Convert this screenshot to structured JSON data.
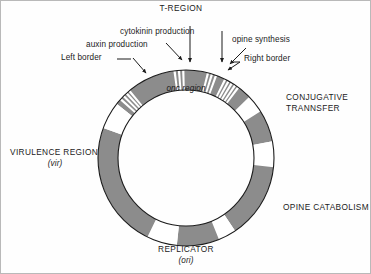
{
  "figure": {
    "kind": "ti-plasmid-circular-map",
    "background_color": "#ffffff",
    "frame_color": "#b9b9b9",
    "segment_fill": "#8c8c8c",
    "ring_outline": "#1b1b1b",
    "text_color": "#1b1b1b"
  },
  "top_labels": {
    "t_region": "T-REGION",
    "cytokinin": "cytokinin production",
    "auxin": "auxin production",
    "left_border": "Left border",
    "opine_synthesis": "opine  synthesis",
    "right_border": "Right border"
  },
  "ring_labels": {
    "onc_region": "onc region",
    "conjugative_line1": "CONJUGATIVE",
    "conjugative_line2": "TRANNSFER",
    "opine_catabolism": "OPINE CATABOLISM",
    "replicator": "REPLICATOR",
    "replicator_sub": "(ori)",
    "virulence": "VIRULENCE REGION",
    "virulence_sub": "(vir)"
  },
  "chart_data": {
    "type": "pie",
    "geometry": {
      "cx": 186,
      "cy": 158,
      "r_outer": 88,
      "r_inner": 68,
      "angle_zero": "top",
      "direction": "clockwise"
    },
    "legend_position": "around-ring",
    "grid": false,
    "segments": [
      {
        "name": "T-region (onc region)",
        "start_deg": -52,
        "end_deg": 46,
        "fill": "#8c8c8c",
        "striped": true
      },
      {
        "name": "conjugative-transfer-upper",
        "start_deg": 58,
        "end_deg": 79,
        "fill": "#8c8c8c"
      },
      {
        "name": "conjugative-transfer-gap",
        "start_deg": 79,
        "end_deg": 96,
        "fill": "#ffffff"
      },
      {
        "name": "opine-catabolism",
        "start_deg": 96,
        "end_deg": 146,
        "fill": "#8c8c8c"
      },
      {
        "name": "opine-catabolism-gap",
        "start_deg": 146,
        "end_deg": 158,
        "fill": "#ffffff"
      },
      {
        "name": "replicator",
        "start_deg": 158,
        "end_deg": 186,
        "fill": "#8c8c8c"
      },
      {
        "name": "replicator-gap",
        "start_deg": 186,
        "end_deg": 206,
        "fill": "#ffffff"
      },
      {
        "name": "virulence-region",
        "start_deg": 206,
        "end_deg": 290,
        "fill": "#8c8c8c"
      },
      {
        "name": "virulence-gap",
        "start_deg": 290,
        "end_deg": 308,
        "fill": "#ffffff"
      }
    ],
    "t_region_stripes": {
      "left_border_group_deg": [
        -48,
        -45.2,
        -42.6,
        -40.2
      ],
      "cytokinin_group_deg": [
        -7.5,
        -4.6,
        -1.8
      ],
      "opine_group_deg": [
        14.5,
        17.2,
        20.0,
        26.5,
        29.0,
        31.5,
        34.0,
        36.5
      ],
      "stripe_color": "#ffffff"
    }
  }
}
